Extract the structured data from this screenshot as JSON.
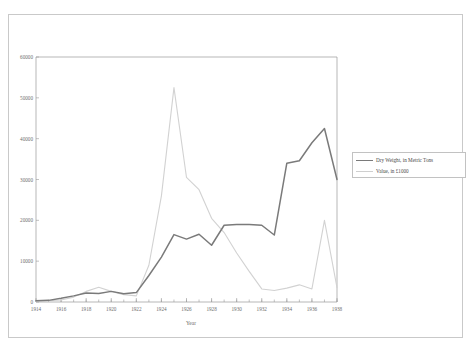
{
  "chart_data": {
    "type": "line",
    "xlabel": "Year",
    "ylabel": "",
    "xlim": [
      1914,
      1938
    ],
    "ylim": [
      0,
      60000
    ],
    "grid": false,
    "legend_position": "right",
    "x": [
      1914,
      1915,
      1916,
      1917,
      1918,
      1919,
      1920,
      1921,
      1922,
      1923,
      1924,
      1925,
      1926,
      1927,
      1928,
      1929,
      1930,
      1931,
      1932,
      1933,
      1934,
      1935,
      1936,
      1937,
      1938
    ],
    "xticks": [
      1914,
      1916,
      1918,
      1920,
      1922,
      1924,
      1926,
      1928,
      1930,
      1932,
      1934,
      1936,
      1938
    ],
    "xtick_labels": [
      "1914",
      "1916",
      "1918",
      "1920",
      "1922",
      "1924",
      "1926",
      "1928",
      "1930",
      "1932",
      "1934",
      "1936",
      "1938"
    ],
    "yticks": [
      0,
      10000,
      20000,
      30000,
      40000,
      50000,
      60000
    ],
    "ytick_labels": [
      "0",
      "10000",
      "20000",
      "30000",
      "40000",
      "50000",
      "60000"
    ],
    "series": [
      {
        "name": "Dry Weight, in Metric Tons",
        "color": "#7a7a7a",
        "width": 1.5,
        "values": [
          300,
          400,
          900,
          1500,
          2200,
          2100,
          2600,
          2000,
          2300,
          6500,
          11000,
          16500,
          15400,
          16600,
          13900,
          18800,
          19000,
          19000,
          18800,
          16400,
          34000,
          34600,
          39000,
          42500,
          30000
        ]
      },
      {
        "name": "Value, in £1000",
        "color": "#d2d2d2",
        "width": 1.1,
        "values": [
          200,
          300,
          500,
          1200,
          2600,
          3600,
          2600,
          1800,
          1500,
          9000,
          26000,
          52500,
          30500,
          27500,
          20500,
          17000,
          12000,
          7500,
          3200,
          2800,
          3400,
          4200,
          3200,
          20000,
          3500
        ]
      }
    ]
  },
  "legend": {
    "items": [
      {
        "label": "Dry Weight, in Metric Tons"
      },
      {
        "label": "Value, in £1000"
      }
    ]
  },
  "axes": {
    "x_title": "Year"
  }
}
